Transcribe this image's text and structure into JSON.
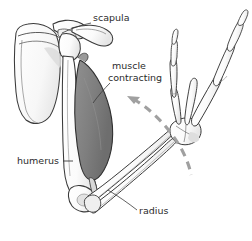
{
  "figure": {
    "background_color": "#ffffff",
    "width": 252,
    "height": 241
  },
  "colors": {
    "bone_fill": "#fafafa",
    "bone_fill_shadow": "#e4e4e4",
    "bone_outline": "#3a3a3a",
    "muscle_fill": "#808080",
    "muscle_outline": "#2f2f2f",
    "arrow": "#a0a0a0",
    "label_text": "#2b2b2b",
    "leader_line": "#3a3a3a"
  },
  "labels": [
    {
      "id": "scapula",
      "text": "scapula",
      "x": 93,
      "y": 21,
      "anchor": "start"
    },
    {
      "id": "muscle-contracting-line1",
      "text": "muscle",
      "x": 112,
      "y": 69,
      "anchor": "start"
    },
    {
      "id": "muscle-contracting-line2",
      "text": "contracting",
      "x": 108,
      "y": 81,
      "anchor": "start"
    },
    {
      "id": "humerus",
      "text": "humerus",
      "x": 17,
      "y": 164,
      "anchor": "start"
    },
    {
      "id": "radius",
      "text": "radius",
      "x": 139,
      "y": 214,
      "anchor": "start"
    }
  ],
  "annotations": {
    "motion_arrow": {
      "name": "motion-arrow",
      "style": "dashed-curved-arrow",
      "direction": "up-left",
      "meaning": "direction of forearm movement",
      "head_x": 128,
      "head_y": 97
    }
  },
  "anatomy_parts": [
    {
      "id": "scapula",
      "name": "scapula",
      "fill": "bone"
    },
    {
      "id": "clavicle",
      "name": "clavicle",
      "fill": "bone"
    },
    {
      "id": "humerus",
      "name": "humerus",
      "fill": "bone"
    },
    {
      "id": "muscle",
      "name": "muscle contracting",
      "fill": "muscle"
    },
    {
      "id": "radius",
      "name": "radius",
      "fill": "bone"
    },
    {
      "id": "ulna",
      "name": "ulna",
      "fill": "bone"
    },
    {
      "id": "carpals",
      "name": "carpals",
      "fill": "bone"
    },
    {
      "id": "metacarpals",
      "name": "metacarpals",
      "fill": "bone"
    },
    {
      "id": "phalanges",
      "name": "phalanges",
      "fill": "bone"
    }
  ]
}
